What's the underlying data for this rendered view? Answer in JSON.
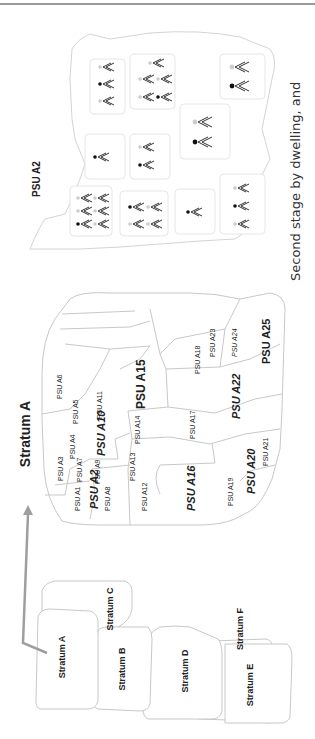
{
  "figure": {
    "top_rule_color": "#9a9a9a",
    "stratum_map": {
      "strata": [
        {
          "id": "A",
          "label": "Stratum A"
        },
        {
          "id": "B",
          "label": "Stratum B"
        },
        {
          "id": "C",
          "label": "Stratum C"
        },
        {
          "id": "D",
          "label": "Stratum D"
        },
        {
          "id": "E",
          "label": "Stratum E"
        },
        {
          "id": "F",
          "label": "Stratum F"
        }
      ]
    },
    "arrow": {
      "from": "Stratum A",
      "to": "Stratum A detail",
      "color": "#9e9e9e"
    },
    "stratum_detail": {
      "title": "Stratum A",
      "psus": [
        {
          "label": "PSU A1",
          "emphasis": false
        },
        {
          "label": "PSU A2",
          "emphasis": true
        },
        {
          "label": "PSU A3",
          "emphasis": false
        },
        {
          "label": "PSU A4",
          "emphasis": false
        },
        {
          "label": "PSU A5",
          "emphasis": false
        },
        {
          "label": "PSU A6",
          "emphasis": false
        },
        {
          "label": "PSU A7",
          "emphasis": false
        },
        {
          "label": "PSU A8",
          "emphasis": false
        },
        {
          "label": "PSU A9",
          "emphasis": false
        },
        {
          "label": "PSU A10",
          "emphasis": true
        },
        {
          "label": "PSU A11",
          "emphasis": false
        },
        {
          "label": "PSU A12",
          "emphasis": false
        },
        {
          "label": "PSU A13",
          "emphasis": false
        },
        {
          "label": "PSU A14",
          "emphasis": false
        },
        {
          "label": "PSU A15",
          "emphasis": true
        },
        {
          "label": "PSU A16",
          "emphasis": true
        },
        {
          "label": "PSU A17",
          "emphasis": false
        },
        {
          "label": "PSU A18",
          "emphasis": false
        },
        {
          "label": "PSU A19",
          "emphasis": false
        },
        {
          "label": "PSU A20",
          "emphasis": true
        },
        {
          "label": "PSU A21",
          "emphasis": false
        },
        {
          "label": "PSU A22",
          "emphasis": true
        },
        {
          "label": "PSU A23",
          "emphasis": false
        },
        {
          "label": "PSU A24",
          "emphasis": false
        },
        {
          "label": "PSU A25",
          "emphasis": true
        }
      ]
    },
    "psu_detail": {
      "title": "PSU A2",
      "legend": {
        "selected_person_marker": "black-dot",
        "selected_color": "#111111",
        "unselected_color": "#cfcfcf"
      },
      "dwellings": [
        {
          "persons": 6,
          "selected": 1
        },
        {
          "persons": 4,
          "selected": 1
        },
        {
          "persons": 1,
          "selected": 1
        },
        {
          "persons": 3,
          "selected": 1
        },
        {
          "persons": 1,
          "selected": 1
        },
        {
          "persons": 2,
          "selected": 1
        },
        {
          "persons": 2,
          "selected": 1
        },
        {
          "persons": 3,
          "selected": 1
        },
        {
          "persons": 5,
          "selected": 1
        },
        {
          "persons": 2,
          "selected": 1
        }
      ]
    },
    "caption": "Second stage by dwelling, and"
  }
}
